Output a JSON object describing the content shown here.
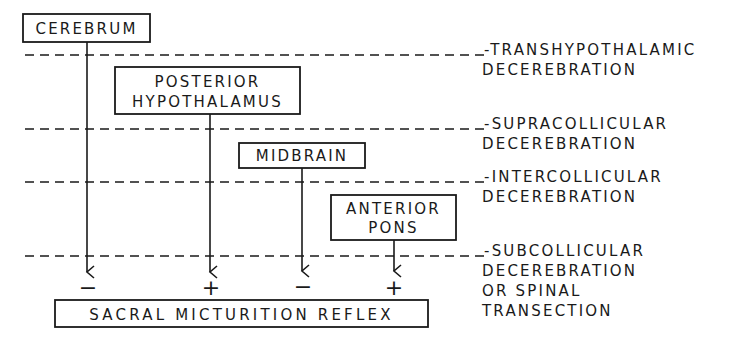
{
  "diagram": {
    "type": "hierarchical control diagram",
    "colors": {
      "ink": "#1a1a1a",
      "background": "#ffffff"
    },
    "centers": [
      {
        "id": "cerebrum",
        "lines": [
          "CEREBRUM"
        ],
        "effect": "−"
      },
      {
        "id": "posterior-hypothalamus",
        "lines": [
          "POSTERIOR",
          "HYPOTHALAMUS"
        ],
        "effect": "+"
      },
      {
        "id": "midbrain",
        "lines": [
          "MIDBRAIN"
        ],
        "effect": "−"
      },
      {
        "id": "anterior-pons",
        "lines": [
          "ANTERIOR",
          "PONS"
        ],
        "effect": "+"
      }
    ],
    "target": {
      "label": "SACRAL MICTURITION REFLEX"
    },
    "levels": [
      {
        "id": "transhypothalamic",
        "lines": [
          "TRANSHYPOTHALAMIC",
          "DECEREBRATION"
        ]
      },
      {
        "id": "supracollicular",
        "lines": [
          "SUPRACOLLICULAR",
          "DECEREBRATION"
        ]
      },
      {
        "id": "intercollicular",
        "lines": [
          "INTERCOLLICULAR",
          "DECEREBRATION"
        ]
      },
      {
        "id": "subcollicular",
        "lines": [
          "SUBCOLLICULAR",
          "DECEREBRATION",
          "OR SPINAL",
          "TRANSECTION"
        ]
      }
    ]
  }
}
